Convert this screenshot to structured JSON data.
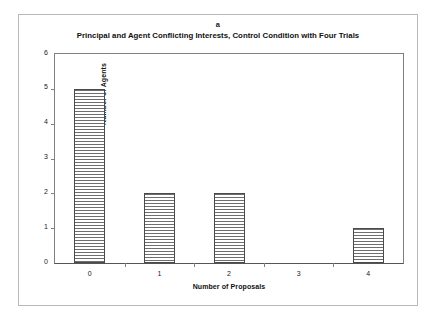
{
  "figure": {
    "panel_letter": "a",
    "title": "Principal and Agent Conflicting Interests, Control Condition with Four Trials"
  },
  "chart_data": {
    "type": "bar",
    "title": "Principal and Agent Conflicting Interests, Control Condition with Four Trials",
    "panel": "a",
    "categories": [
      "0",
      "1",
      "2",
      "3",
      "4"
    ],
    "values": [
      5,
      2,
      2,
      0,
      1
    ],
    "xlabel": "Number of Proposals",
    "ylabel": "Number of Agents",
    "ylim": [
      0,
      6
    ],
    "yticks": [
      "6",
      "5",
      "4",
      "3",
      "2",
      "1",
      "0"
    ],
    "ytick_values": [
      6,
      5,
      4,
      3,
      2,
      1,
      0
    ],
    "xticks": [
      "0",
      "1",
      "2",
      "3",
      "4"
    ],
    "grid": false,
    "legend": null,
    "bar_fill": "horizontal-hatch",
    "bar_edge_color": "#4a4a4a",
    "hatch_color": "#6e6e6e",
    "background_color": "#ffffff",
    "frame_color": "#808080"
  }
}
